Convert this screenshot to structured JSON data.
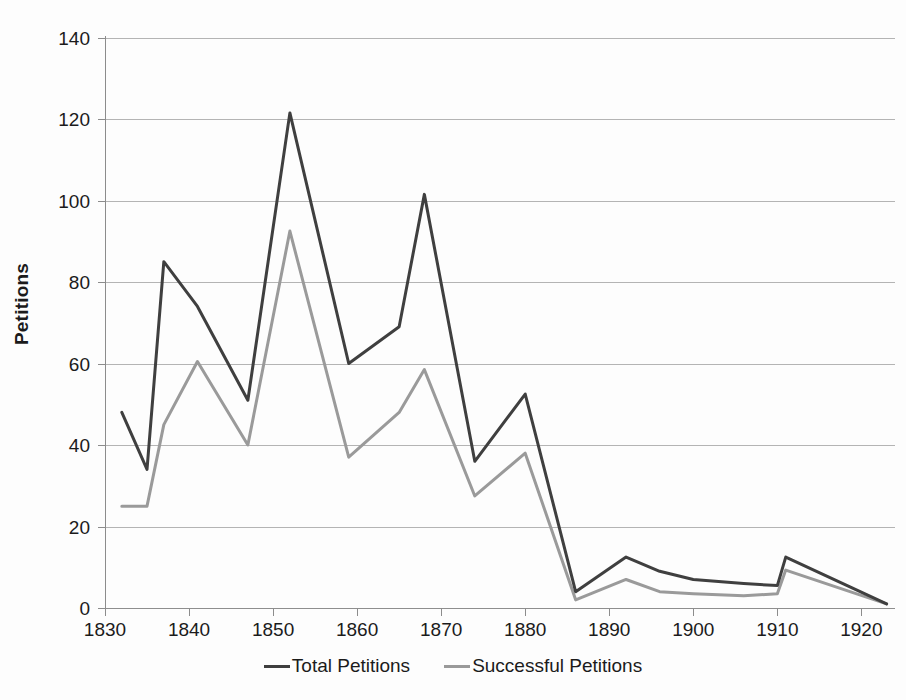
{
  "chart_data": {
    "type": "line",
    "title": "",
    "xlabel": "",
    "ylabel": "Petitions",
    "xlim": [
      1830,
      1924
    ],
    "ylim": [
      0,
      140
    ],
    "grid": true,
    "legend_position": "bottom",
    "y_ticks": [
      0,
      20,
      40,
      60,
      80,
      100,
      120,
      140
    ],
    "x_ticks": [
      1830,
      1840,
      1850,
      1860,
      1870,
      1880,
      1890,
      1900,
      1910,
      1920
    ],
    "x": [
      1832,
      1835,
      1837,
      1841,
      1847,
      1852,
      1859,
      1865,
      1868,
      1874,
      1880,
      1886,
      1892,
      1896,
      1900,
      1906,
      1910,
      1911,
      1923
    ],
    "series": [
      {
        "name": "Total Petitions",
        "color": "#3f3f3f",
        "values": [
          48,
          34,
          85,
          74,
          51,
          121.5,
          60,
          69,
          101.5,
          36,
          52.5,
          4,
          12.5,
          9,
          7,
          6,
          5.5,
          12.5,
          1
        ]
      },
      {
        "name": "Successful Petitions",
        "color": "#9a9a9a",
        "values": [
          25,
          25,
          45,
          60.5,
          40,
          92.5,
          37,
          48,
          58.5,
          27.5,
          38,
          2,
          7,
          4,
          3.5,
          3,
          3.5,
          9.3,
          1
        ]
      }
    ]
  },
  "axis": {
    "y_title": "Petitions",
    "y_tick_labels": [
      "0",
      "20",
      "40",
      "60",
      "80",
      "100",
      "120",
      "140"
    ],
    "x_tick_labels": [
      "1830",
      "1840",
      "1850",
      "1860",
      "1870",
      "1880",
      "1890",
      "1900",
      "1910",
      "1920"
    ]
  },
  "legend": {
    "items": [
      {
        "label": "Total Petitions",
        "color": "#3f3f3f"
      },
      {
        "label": "Successful Petitions",
        "color": "#9a9a9a"
      }
    ]
  }
}
